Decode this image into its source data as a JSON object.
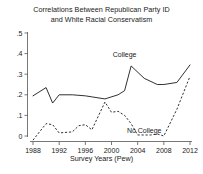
{
  "chart_data": {
    "type": "line",
    "title": "Correlations Between Republican Party ID and White Racial Conservatism",
    "title_line1": "Correlations Between Republican Party ID",
    "title_line2": "and White Racial Conservatism",
    "xlabel": "Survey Years (Pew)",
    "ylabel": "",
    "xlim": [
      1988,
      2012
    ],
    "ylim": [
      0.0,
      0.5
    ],
    "grid": false,
    "legend_position": "inline-annotation",
    "xticks": [
      1988,
      1992,
      1996,
      2000,
      2004,
      2008,
      2012
    ],
    "xtick_labels": [
      "1988",
      "1992",
      "1996",
      "2000",
      "2004",
      "2008",
      "2012"
    ],
    "yticks": [
      0,
      0.1,
      0.2,
      0.3,
      0.4,
      0.5
    ],
    "ytick_labels": [
      "0",
      ".1",
      ".2",
      ".3",
      ".4",
      ".5"
    ],
    "series": [
      {
        "name": "College",
        "style": "solid",
        "label_text": "College",
        "label_x": 2002,
        "label_y": 0.385,
        "x": [
          1988,
          1990,
          1991,
          1992,
          1994,
          1996,
          1997,
          1999,
          2001,
          2002,
          2003,
          2005,
          2007,
          2008,
          2010,
          2012
        ],
        "values": [
          0.195,
          0.235,
          0.16,
          0.2,
          0.2,
          0.195,
          0.19,
          0.18,
          0.2,
          0.22,
          0.34,
          0.28,
          0.25,
          0.25,
          0.26,
          0.345
        ]
      },
      {
        "name": "No College",
        "style": "dashed",
        "label_text": "No College",
        "label_x": 2005,
        "label_y": 0.015,
        "x": [
          1988,
          1989,
          1990,
          1991,
          1992,
          1994,
          1995,
          1996,
          1997,
          1999,
          2000,
          2001,
          2002,
          2003,
          2004,
          2006,
          2007,
          2008,
          2010,
          2012
        ],
        "values": [
          -0.02,
          0.02,
          0.06,
          0.055,
          0.015,
          0.02,
          0.05,
          0.055,
          0.03,
          0.165,
          0.115,
          0.12,
          0.1,
          0.06,
          0.005,
          0.005,
          0.01,
          0.0,
          0.13,
          0.29
        ]
      }
    ]
  }
}
